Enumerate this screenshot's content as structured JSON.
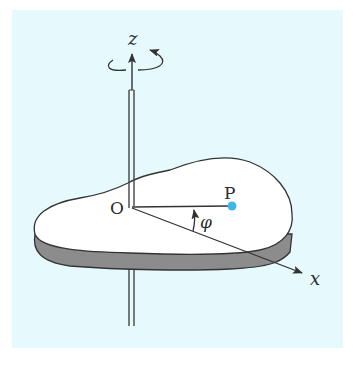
{
  "figure": {
    "kind": "rigid-body-rotation-diagram",
    "panel_color": "#e6fafd",
    "labels": {
      "z_axis": "z",
      "x_axis": "x",
      "origin": "O",
      "point": "P",
      "angle": "φ"
    },
    "colors": {
      "stroke": "#333333",
      "disc_top": "#ffffff",
      "disc_side": "#8c8c8c",
      "point_P": "#3fb6ea"
    },
    "elements": [
      "rotation-axis-z",
      "rotation-direction-arrow",
      "flat-irregular-disc",
      "origin-O",
      "point-P",
      "x-axis",
      "angle-phi"
    ]
  }
}
